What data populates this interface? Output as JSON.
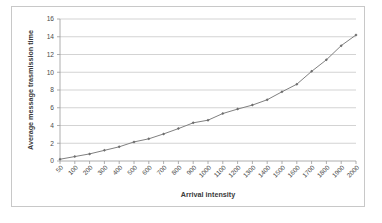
{
  "chart_data": {
    "type": "line",
    "title": "",
    "xlabel": "Arrival intensity",
    "ylabel": "Average message trasmission time",
    "categories": [
      "50",
      "100",
      "200",
      "300",
      "400",
      "500",
      "600",
      "700",
      "800",
      "900",
      "1000",
      "1100",
      "1200",
      "1300",
      "1400",
      "1500",
      "1600",
      "1700",
      "1800",
      "1900",
      "2000"
    ],
    "values": [
      0.2,
      0.5,
      0.8,
      1.2,
      1.6,
      2.15,
      2.5,
      3.05,
      3.65,
      4.3,
      4.6,
      5.35,
      5.85,
      6.3,
      6.9,
      7.8,
      8.65,
      10.1,
      11.4,
      13.0,
      14.2
    ],
    "series": [
      {
        "name": "Average message trasmission time",
        "values": [
          0.2,
          0.5,
          0.8,
          1.2,
          1.6,
          2.15,
          2.5,
          3.05,
          3.65,
          4.3,
          4.6,
          5.35,
          5.85,
          6.3,
          6.9,
          7.8,
          8.65,
          10.1,
          11.4,
          13.0,
          14.2
        ]
      }
    ],
    "ylim": [
      0,
      16
    ],
    "ytick_labels": [
      "0",
      "2",
      "4",
      "6",
      "8",
      "10",
      "12",
      "14",
      "16"
    ],
    "ytick_values": [
      0,
      2,
      4,
      6,
      8,
      10,
      12,
      14,
      16
    ],
    "grid": "horizontal",
    "legend": "none",
    "line_color": "#808080",
    "marker": "diamond",
    "marker_color": "#6e6e6e",
    "grid_color": "#c0c0c0",
    "axis_color": "#9a9a9a",
    "xtick_rotation": -45
  }
}
